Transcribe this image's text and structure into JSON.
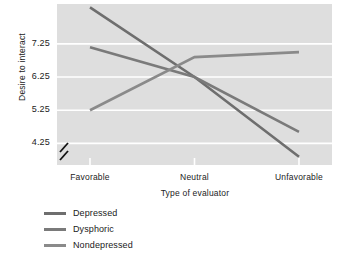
{
  "chart_data": {
    "type": "line",
    "title": "",
    "xlabel": "Type of evaluator",
    "ylabel": "Desire to interact",
    "categories": [
      "Favorable",
      "Neutral",
      "Unfavorable"
    ],
    "yticks": [
      "7.25",
      "6.25",
      "5.25",
      "4.25"
    ],
    "ytick_values": [
      7.25,
      6.25,
      5.25,
      4.25
    ],
    "ylim": [
      3.6,
      8.45
    ],
    "axis_break": true,
    "grid": true,
    "grid_color": "#ffffff",
    "plot_background": "#dedede",
    "legend_position": "below-left",
    "series": [
      {
        "name": "Depressed",
        "color": "#6e6e6e",
        "values": [
          8.35,
          6.25,
          3.85
        ]
      },
      {
        "name": "Dysphoric",
        "color": "#7a7a7a",
        "values": [
          7.15,
          6.25,
          4.6
        ]
      },
      {
        "name": "Nondepressed",
        "color": "#8a8a8a",
        "values": [
          5.25,
          6.85,
          7.0
        ]
      }
    ]
  },
  "legend": {
    "items": [
      {
        "label": "Depressed"
      },
      {
        "label": "Dysphoric"
      },
      {
        "label": "Nondepressed"
      }
    ]
  }
}
